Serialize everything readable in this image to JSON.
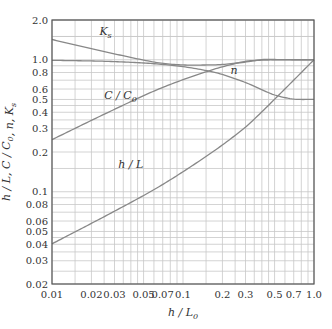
{
  "chart_data": {
    "type": "line",
    "title": "",
    "xlabel": "h/L0",
    "ylabel": "h/L, C/C0, n, Ks",
    "xscale": "log",
    "yscale": "log",
    "xlim": [
      0.01,
      1.0
    ],
    "ylim": [
      0.02,
      2.0
    ],
    "grid": true,
    "legend": "none (inline curve labels)",
    "x_ticks": [
      0.01,
      0.02,
      0.03,
      0.05,
      0.07,
      0.1,
      0.2,
      0.3,
      0.5,
      0.7,
      1.0
    ],
    "x_tick_labels": [
      "0.01",
      "0.02",
      "0.03",
      "0.05",
      "0.07",
      "0.1",
      "0.2",
      "0.3",
      "0.5",
      "0.7",
      "1.0"
    ],
    "y_ticks": [
      0.02,
      0.03,
      0.04,
      0.05,
      0.06,
      0.08,
      0.1,
      0.2,
      0.3,
      0.4,
      0.5,
      0.6,
      0.8,
      1.0,
      2.0
    ],
    "y_tick_labels": [
      "0.02",
      "0.03",
      "0.04",
      "0.05",
      "0.06",
      "0.08",
      "0.1",
      "0.2",
      "0.3",
      "0.4",
      "0.5",
      "0.6",
      "0.8",
      "1.0",
      "2.0"
    ],
    "x": [
      0.01,
      0.02,
      0.03,
      0.05,
      0.07,
      0.1,
      0.15,
      0.2,
      0.3,
      0.4,
      0.5,
      0.7,
      1.0
    ],
    "series": [
      {
        "name": "h/L",
        "label": "h/L",
        "values": [
          0.0403,
          0.0576,
          0.0712,
          0.0936,
          0.1135,
          0.1417,
          0.1852,
          0.2263,
          0.3088,
          0.4032,
          0.5017,
          0.7,
          1.0
        ]
      },
      {
        "name": "C/C0",
        "label": "C/C0",
        "values": [
          0.2481,
          0.3472,
          0.4211,
          0.5342,
          0.6167,
          0.7057,
          0.81,
          0.8838,
          0.9715,
          0.992,
          0.9967,
          0.9994,
          1.0
        ]
      },
      {
        "name": "n",
        "label": "n",
        "values": [
          0.9896,
          0.9787,
          0.9676,
          0.9448,
          0.9214,
          0.8862,
          0.8285,
          0.7729,
          0.6721,
          0.5927,
          0.5409,
          0.5038,
          0.5002
        ]
      },
      {
        "name": "Ks",
        "label": "Ks",
        "values": [
          1.4236,
          1.2127,
          1.108,
          0.9939,
          0.9382,
          0.9131,
          0.9126,
          0.9209,
          0.9602,
          1.0026,
          1.0037,
          1.0,
          1.0
        ]
      }
    ],
    "annotations": [
      {
        "text": "Ks",
        "near_series": "Ks"
      },
      {
        "text": "C/C0",
        "near_series": "C/C0"
      },
      {
        "text": "n",
        "near_series": "n"
      },
      {
        "text": "h/L",
        "near_series": "h/L"
      }
    ]
  }
}
